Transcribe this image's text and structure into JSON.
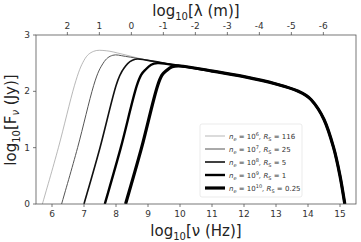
{
  "chart_data": {
    "type": "line",
    "title": "",
    "xlabel": "log10[ν (Hz)]",
    "ylabel": "log10[Fν (Jy)]",
    "top_xlabel": "log10[λ (m)]",
    "xlim": [
      5.5,
      15.5
    ],
    "ylim": [
      0,
      3
    ],
    "x_ticks": [
      6,
      7,
      8,
      9,
      10,
      11,
      12,
      13,
      14,
      15
    ],
    "y_ticks": [
      0,
      1,
      2,
      3
    ],
    "top_x_ticks": [
      {
        "label": "2",
        "nu": 6.48
      },
      {
        "label": "1",
        "nu": 7.48
      },
      {
        "label": "0",
        "nu": 8.48
      },
      {
        "label": "-1",
        "nu": 9.48
      },
      {
        "label": "-2",
        "nu": 10.48
      },
      {
        "label": "-3",
        "nu": 11.48
      },
      {
        "label": "-4",
        "nu": 12.48
      },
      {
        "label": "-5",
        "nu": 13.48
      },
      {
        "label": "-6",
        "nu": 14.48
      }
    ],
    "grid": false,
    "legend_position": "lower right (inside)",
    "series": [
      {
        "name": "n_e = 10^6, R_S = 116",
        "ne_exp": "6",
        "rs": "116",
        "width": 0.6,
        "color": "#888888",
        "x": [
          5.7,
          6.2,
          6.7,
          7.0,
          7.3,
          7.7,
          8.2,
          9.0,
          10.0,
          11.0,
          12.0,
          13.0,
          13.7,
          14.1,
          14.5,
          14.8,
          15.0,
          15.15
        ],
        "y": [
          0.0,
          1.0,
          2.1,
          2.55,
          2.71,
          2.72,
          2.66,
          2.55,
          2.45,
          2.36,
          2.26,
          2.13,
          2.0,
          1.85,
          1.5,
          1.0,
          0.5,
          0.0
        ]
      },
      {
        "name": "n_e = 10^7, R_S = 25",
        "ne_exp": "7",
        "rs": "25",
        "width": 1.0,
        "color": "#555555",
        "x": [
          6.3,
          6.8,
          7.3,
          7.6,
          7.9,
          8.3,
          9.0,
          10.0,
          11.0,
          12.0,
          13.0,
          13.7,
          14.1,
          14.5,
          14.8,
          15.0,
          15.15
        ],
        "y": [
          0.0,
          1.0,
          2.1,
          2.5,
          2.64,
          2.62,
          2.55,
          2.45,
          2.36,
          2.26,
          2.13,
          2.0,
          1.85,
          1.5,
          1.0,
          0.5,
          0.0
        ]
      },
      {
        "name": "n_e = 10^8, R_S = 5",
        "ne_exp": "8",
        "rs": "5",
        "width": 1.6,
        "color": "#111111",
        "x": [
          7.0,
          7.5,
          8.0,
          8.3,
          8.6,
          9.0,
          10.0,
          11.0,
          12.0,
          13.0,
          13.7,
          14.1,
          14.5,
          14.8,
          15.0,
          15.15
        ],
        "y": [
          0.0,
          1.0,
          2.1,
          2.45,
          2.57,
          2.55,
          2.45,
          2.36,
          2.26,
          2.13,
          2.0,
          1.85,
          1.5,
          1.0,
          0.5,
          0.0
        ]
      },
      {
        "name": "n_e = 10^9, R_S = 1",
        "ne_exp": "9",
        "rs": "1",
        "width": 2.4,
        "color": "#000000",
        "x": [
          7.65,
          8.15,
          8.65,
          8.95,
          9.3,
          10.0,
          11.0,
          12.0,
          13.0,
          13.7,
          14.1,
          14.5,
          14.8,
          15.0,
          15.15
        ],
        "y": [
          0.0,
          1.0,
          2.1,
          2.4,
          2.5,
          2.45,
          2.36,
          2.26,
          2.13,
          2.0,
          1.85,
          1.5,
          1.0,
          0.5,
          0.0
        ]
      },
      {
        "name": "n_e = 10^10, R_S = 0.25",
        "ne_exp": "10",
        "rs": "0.25",
        "width": 3.2,
        "color": "#000000",
        "x": [
          8.3,
          8.8,
          9.3,
          9.6,
          10.0,
          11.0,
          12.0,
          13.0,
          13.7,
          14.1,
          14.5,
          14.8,
          15.0,
          15.15
        ],
        "y": [
          0.0,
          1.0,
          2.1,
          2.38,
          2.45,
          2.36,
          2.26,
          2.13,
          2.0,
          1.85,
          1.5,
          1.0,
          0.5,
          0.0
        ]
      }
    ]
  },
  "frame": {
    "left": 36,
    "top": 35,
    "right": 356,
    "bottom": 204
  },
  "legend": {
    "entries": [
      {
        "ne": "n",
        "sub": "e",
        "eq1": " = 10",
        "sup": "6",
        "rs": ", R",
        "rsub": "S",
        "eq2": " = 116"
      },
      {
        "ne": "n",
        "sub": "e",
        "eq1": " = 10",
        "sup": "7",
        "rs": ", R",
        "rsub": "S",
        "eq2": " = 25"
      },
      {
        "ne": "n",
        "sub": "e",
        "eq1": " = 10",
        "sup": "8",
        "rs": ", R",
        "rsub": "S",
        "eq2": " = 5"
      },
      {
        "ne": "n",
        "sub": "e",
        "eq1": " = 10",
        "sup": "9",
        "rs": ", R",
        "rsub": "S",
        "eq2": " = 1"
      },
      {
        "ne": "n",
        "sub": "e",
        "eq1": " = 10",
        "sup": "10",
        "rs": ", R",
        "rsub": "S",
        "eq2": " = 0.25"
      }
    ]
  },
  "labels": {
    "x_main": "log",
    "x_sub": "10",
    "x_rest": "[ν (Hz)]",
    "y_main": "log",
    "y_sub": "10",
    "y_rest1": "[F",
    "y_nu": "ν",
    "y_rest2": " (Jy)]",
    "top_main": "log",
    "top_sub": "10",
    "top_rest": "[λ (m)]"
  }
}
